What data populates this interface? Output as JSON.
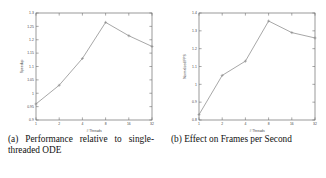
{
  "figure": {
    "subfigures": [
      {
        "id": "a",
        "caption_label": "(a)",
        "caption_text": "Performance relative to single-threaded ODE"
      },
      {
        "id": "b",
        "caption_label": "(b)",
        "caption_text": "Effect on Frames per Second"
      }
    ]
  },
  "chart_data": [
    {
      "type": "line",
      "title": "",
      "xlabel": "# Threads",
      "ylabel": "Speedup",
      "x": [
        1,
        2,
        4,
        8,
        16,
        32
      ],
      "xticklabels": [
        "1",
        "2",
        "4",
        "8",
        "16",
        "32"
      ],
      "xscale": "log2",
      "xlim": [
        1,
        32
      ],
      "values": [
        0.96,
        1.03,
        1.13,
        1.265,
        1.215,
        1.175
      ],
      "ylim": [
        0.9,
        1.3
      ],
      "yticks": [
        0.9,
        0.95,
        1,
        1.05,
        1.1,
        1.15,
        1.2,
        1.25,
        1.3
      ],
      "yticklabels": [
        "0.9",
        "0.95",
        "1",
        "1.05",
        "1.1",
        "1.15",
        "1.2",
        "1.25",
        "1.3"
      ],
      "grid": false,
      "legend": "none",
      "marker": "plus",
      "line_color": "#8a8a8a"
    },
    {
      "type": "line",
      "title": "",
      "xlabel": "# Threads",
      "ylabel": "Normalized FPS",
      "x": [
        1,
        2,
        4,
        8,
        16,
        32
      ],
      "xticklabels": [
        "1",
        "2",
        "4",
        "8",
        "16",
        "32"
      ],
      "xscale": "log2",
      "xlim": [
        1,
        32
      ],
      "values": [
        0.83,
        1.05,
        1.13,
        1.355,
        1.29,
        1.26
      ],
      "ylim": [
        0.8,
        1.4
      ],
      "yticks": [
        0.8,
        0.9,
        1,
        1.1,
        1.2,
        1.3,
        1.4
      ],
      "yticklabels": [
        "0.8",
        "0.9",
        "1",
        "1.1",
        "1.2",
        "1.3",
        "1.4"
      ],
      "grid": false,
      "legend": "none",
      "marker": "plus",
      "line_color": "#8a8a8a"
    }
  ]
}
